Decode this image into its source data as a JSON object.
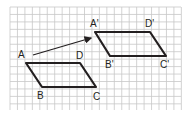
{
  "diagram": {
    "type": "translation-on-grid",
    "grid": {
      "x0": 10,
      "y0": 7,
      "x1": 181,
      "y1": 110,
      "spacing": 7.45,
      "line_color": "#c8c8c8"
    },
    "original": {
      "name": "ABCD",
      "vertices": [
        {
          "label": "A",
          "x": 26,
          "y": 63,
          "lx": 18,
          "ly": 58
        },
        {
          "label": "B",
          "x": 42,
          "y": 87,
          "lx": 37,
          "ly": 99
        },
        {
          "label": "C",
          "x": 96,
          "y": 87,
          "lx": 93,
          "ly": 100
        },
        {
          "label": "D",
          "x": 80,
          "y": 63,
          "lx": 76,
          "ly": 59
        }
      ]
    },
    "image": {
      "name": "A'B'C'D'",
      "vertices": [
        {
          "label": "A'",
          "x": 95,
          "y": 32,
          "lx": 90,
          "ly": 27
        },
        {
          "label": "B'",
          "x": 110,
          "y": 56,
          "lx": 105,
          "ly": 68
        },
        {
          "label": "C'",
          "x": 166,
          "y": 56,
          "lx": 160,
          "ly": 68
        },
        {
          "label": "D'",
          "x": 150,
          "y": 32,
          "lx": 145,
          "ly": 27
        }
      ]
    },
    "arrow": {
      "x1": 33,
      "y1": 55,
      "x2": 91,
      "y2": 38,
      "label": "translation vector"
    },
    "stroke_color": "#231f20"
  }
}
